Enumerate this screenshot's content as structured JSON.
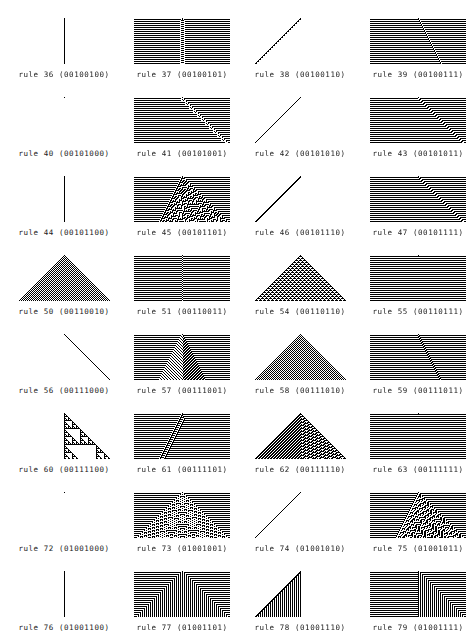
{
  "page": {
    "background_color": "#ffffff",
    "ink_color": "#000000",
    "columns": 4,
    "rows": 8,
    "panel_width_px": 96,
    "panel_height_px": 46,
    "column_pitch_px": 118,
    "row_pitch_px": 79
  },
  "panel_render": {
    "cells_across": 96,
    "generations": 46,
    "initial_condition": "single-center-cell",
    "cell_on_color": "#000000",
    "cell_off_color": "#ffffff"
  },
  "chart_data": {
    "type": "heatmap",
    "xlabel": "",
    "ylabel": "",
    "grid": false,
    "legend": "none",
    "categories": [
      "rule 36",
      "rule 37",
      "rule 38",
      "rule 39",
      "rule 40",
      "rule 41",
      "rule 42",
      "rule 43",
      "rule 44",
      "rule 45",
      "rule 46",
      "rule 47",
      "rule 50",
      "rule 51",
      "rule 54",
      "rule 55",
      "rule 56",
      "rule 57",
      "rule 58",
      "rule 59",
      "rule 60",
      "rule 61",
      "rule 62",
      "rule 63",
      "rule 72",
      "rule 73",
      "rule 74",
      "rule 75",
      "rule 76",
      "rule 77",
      "rule 78",
      "rule 79"
    ],
    "values": [
      36,
      37,
      38,
      39,
      40,
      41,
      42,
      43,
      44,
      45,
      46,
      47,
      50,
      51,
      54,
      55,
      56,
      57,
      58,
      59,
      60,
      61,
      62,
      63,
      72,
      73,
      74,
      75,
      76,
      77,
      78,
      79
    ]
  },
  "panels": [
    {
      "index": 0,
      "row": 0,
      "col": 0,
      "rule": 36,
      "binary": "00100100",
      "label": "rule 36 (00100100)",
      "appearance": "single short vertical line at center"
    },
    {
      "index": 1,
      "row": 0,
      "col": 1,
      "rule": 37,
      "binary": "00100101",
      "label": "rule 37 (00100101)",
      "appearance": "horizontal stripes with dotted vertical band at center"
    },
    {
      "index": 2,
      "row": 0,
      "col": 2,
      "rule": 38,
      "binary": "00100110",
      "label": "rule 38 (00100110)",
      "appearance": "dotted diagonal line rising to the right"
    },
    {
      "index": 3,
      "row": 0,
      "col": 3,
      "rule": 39,
      "binary": "00100111",
      "label": "rule 39 (00100111)",
      "appearance": "horizontal stripes crossed by a dotted diagonal"
    },
    {
      "index": 4,
      "row": 1,
      "col": 0,
      "rule": 40,
      "binary": "00101000",
      "label": "rule 40 (00101000)",
      "appearance": "blank panel"
    },
    {
      "index": 5,
      "row": 1,
      "col": 1,
      "rule": 41,
      "binary": "00101001",
      "label": "rule 41 (00101001)",
      "appearance": "horizontal stripes with ragged descending diagonal"
    },
    {
      "index": 6,
      "row": 1,
      "col": 2,
      "rule": 42,
      "binary": "00101010",
      "label": "rule 42 (00101010)",
      "appearance": "thin solid diagonal line rising to the right"
    },
    {
      "index": 7,
      "row": 1,
      "col": 3,
      "rule": 43,
      "binary": "00101011",
      "label": "rule 43 (00101011)",
      "appearance": "horizontal stripes with descending stepped diagonal"
    },
    {
      "index": 8,
      "row": 2,
      "col": 0,
      "rule": 44,
      "binary": "00101100",
      "label": "rule 44 (00101100)",
      "appearance": "single vertical line at center"
    },
    {
      "index": 9,
      "row": 2,
      "col": 1,
      "rule": 45,
      "binary": "00101101",
      "label": "rule 45 (00101101)",
      "appearance": "chaotic nested triangles over horizontal stripes"
    },
    {
      "index": 10,
      "row": 2,
      "col": 2,
      "rule": 46,
      "binary": "00101110",
      "label": "rule 46 (00101110)",
      "appearance": "solid diagonal line rising to the right"
    },
    {
      "index": 11,
      "row": 2,
      "col": 3,
      "rule": 47,
      "binary": "00101111",
      "label": "rule 47 (00101111)",
      "appearance": "horizontal stripes with descending stepped diagonal"
    },
    {
      "index": 12,
      "row": 3,
      "col": 0,
      "rule": 50,
      "binary": "00110010",
      "label": "rule 50 (00110010)",
      "appearance": "checkerboard filled triangle"
    },
    {
      "index": 13,
      "row": 3,
      "col": 1,
      "rule": 51,
      "binary": "00110011",
      "label": "rule 51 (00110011)",
      "appearance": "horizontal stripes with faint center seam"
    },
    {
      "index": 14,
      "row": 3,
      "col": 2,
      "rule": 54,
      "binary": "00110110",
      "label": "rule 54 (00110110)",
      "appearance": "triangle with diamond lattice texture"
    },
    {
      "index": 15,
      "row": 3,
      "col": 3,
      "rule": 55,
      "binary": "00110111",
      "label": "rule 55 (00110111)",
      "appearance": "dense horizontal stripes"
    },
    {
      "index": 16,
      "row": 4,
      "col": 0,
      "rule": 56,
      "binary": "00111000",
      "label": "rule 56 (00111000)",
      "appearance": "thin diagonal line descending to the right"
    },
    {
      "index": 17,
      "row": 4,
      "col": 1,
      "rule": 57,
      "binary": "00111001",
      "label": "rule 57 (00111001)",
      "appearance": "striped arrowhead with hatched wings"
    },
    {
      "index": 18,
      "row": 4,
      "col": 2,
      "rule": 58,
      "binary": "00111010",
      "label": "rule 58 (00111010)",
      "appearance": "checkerboard filled triangle"
    },
    {
      "index": 19,
      "row": 4,
      "col": 3,
      "rule": 59,
      "binary": "00111011",
      "label": "rule 59 (00111011)",
      "appearance": "horizontal stripes with descending dotted diagonal"
    },
    {
      "index": 20,
      "row": 5,
      "col": 0,
      "rule": 60,
      "binary": "00111100",
      "label": "rule 60 (00111100)",
      "appearance": "Sierpinski triangle, right-angled"
    },
    {
      "index": 21,
      "row": 5,
      "col": 1,
      "rule": 61,
      "binary": "00111101",
      "label": "rule 61 (00111101)",
      "appearance": "horizontal stripes with ladder-like diagonal band"
    },
    {
      "index": 22,
      "row": 5,
      "col": 2,
      "rule": 62,
      "binary": "00111110",
      "label": "rule 62 (00111110)",
      "appearance": "triangle with diagonal striping and nested voids"
    },
    {
      "index": 23,
      "row": 5,
      "col": 3,
      "rule": 63,
      "binary": "00111111",
      "label": "rule 63 (00111111)",
      "appearance": "dense horizontal stripes"
    },
    {
      "index": 24,
      "row": 6,
      "col": 0,
      "rule": 72,
      "binary": "01001000",
      "label": "rule 72 (01001000)",
      "appearance": "blank panel"
    },
    {
      "index": 25,
      "row": 6,
      "col": 1,
      "rule": 73,
      "binary": "01001001",
      "label": "rule 73 (01001001)",
      "appearance": "mottled triangle over horizontal stripes"
    },
    {
      "index": 26,
      "row": 6,
      "col": 2,
      "rule": 74,
      "binary": "01001010",
      "label": "rule 74 (01001010)",
      "appearance": "thin diagonal line rising to the right"
    },
    {
      "index": 27,
      "row": 6,
      "col": 3,
      "rule": 75,
      "binary": "01001011",
      "label": "rule 75 (01001011)",
      "appearance": "chaotic nested triangles over horizontal stripes"
    },
    {
      "index": 28,
      "row": 7,
      "col": 0,
      "rule": 76,
      "binary": "01001100",
      "label": "rule 76 (01001100)",
      "appearance": "single vertical line at center"
    },
    {
      "index": 29,
      "row": 7,
      "col": 1,
      "rule": 77,
      "binary": "01001101",
      "label": "rule 77 (01001101)",
      "appearance": "nested right-angle frames around center"
    },
    {
      "index": 30,
      "row": 7,
      "col": 2,
      "rule": 78,
      "binary": "01001110",
      "label": "rule 78 (01001110)",
      "appearance": "right triangle filled with vertical bars"
    },
    {
      "index": 31,
      "row": 7,
      "col": 3,
      "rule": 79,
      "binary": "01001111",
      "label": "rule 79 (01001111)",
      "appearance": "horizontal stripes left, nested right-angle frames right"
    }
  ]
}
